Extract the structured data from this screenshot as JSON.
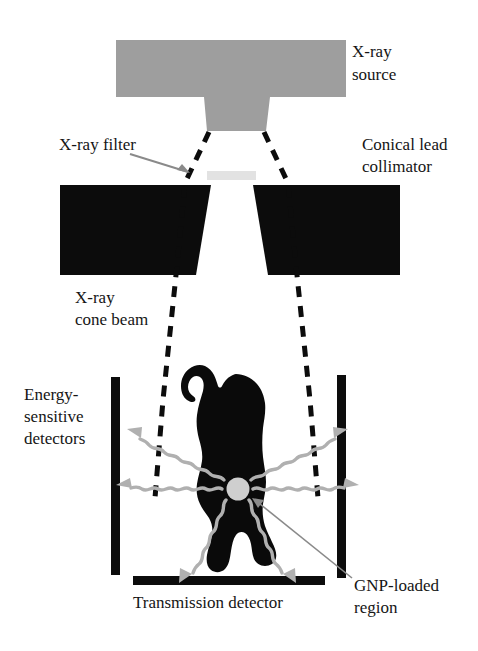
{
  "figure": {
    "background_color": "#ffffff"
  },
  "colors": {
    "source_gray": "#9e9e9e",
    "lead_black": "#0c0c0c",
    "filter_gray": "#e2e2e2",
    "gnp_gray": "#cfcfcf",
    "photon_gray": "#b0b0b0",
    "pointer_gray": "#8a8a8a",
    "text_black": "#151515",
    "mouse_black": "#0a0a0a"
  },
  "labels": {
    "xray_source_line1": "X-ray",
    "xray_source_line2": "source",
    "xray_filter": "X-ray filter",
    "conical_collimator_line1": "Conical lead",
    "conical_collimator_line2": "collimator",
    "cone_beam_line1": "X-ray",
    "cone_beam_line2": "cone beam",
    "energy_detectors_line1": "Energy-",
    "energy_detectors_line2": "sensitive",
    "energy_detectors_line3": "detectors",
    "transmission_detector": "Transmission detector",
    "gnp_region_line1": "GNP-loaded",
    "gnp_region_line2": "region"
  },
  "components": {
    "xray_source": {
      "name": "X-ray source",
      "shape": "rectangle-with-tapered-nose",
      "fill": "#9e9e9e"
    },
    "xray_filter": {
      "name": "X-ray filter",
      "shape": "thin-horizontal-bar",
      "fill": "#e2e2e2"
    },
    "collimator_left": {
      "name": "Conical lead collimator left block",
      "shape": "quadrilateral",
      "fill": "#0c0c0c"
    },
    "collimator_right": {
      "name": "Conical lead collimator right block",
      "shape": "quadrilateral",
      "fill": "#0c0c0c"
    },
    "cone_beam": {
      "name": "X-ray cone beam",
      "style": "dashed-outline",
      "stroke": "#0c0c0c"
    },
    "detector_left": {
      "name": "Energy-sensitive detector left",
      "shape": "vertical-bar",
      "fill": "#0c0c0c"
    },
    "detector_right": {
      "name": "Energy-sensitive detector right",
      "shape": "vertical-bar",
      "fill": "#0c0c0c"
    },
    "transmission_detector": {
      "name": "Transmission detector",
      "shape": "horizontal-bar",
      "fill": "#0c0c0c"
    },
    "subject": {
      "name": "Mouse silhouette",
      "fill": "#0a0a0a"
    },
    "gnp_region": {
      "name": "GNP-loaded region",
      "shape": "circle",
      "fill": "#cfcfcf"
    },
    "scatter_photons": {
      "name": "Scattered fluorescence photons",
      "style": "wavy-arrows",
      "count": 6,
      "stroke": "#b0b0b0"
    }
  }
}
